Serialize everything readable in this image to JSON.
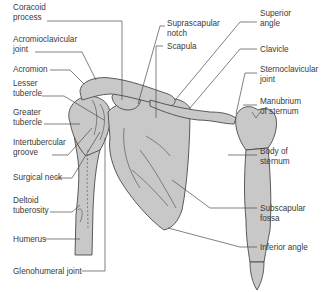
{
  "diagram": {
    "colors": {
      "bone_fill": "#c8c8c8",
      "outline": "#4a4a4a",
      "text": "#3a3a3a",
      "background": "#ffffff"
    },
    "labels_left": [
      {
        "id": "coracoid",
        "lines": [
          "Coracoid",
          "process"
        ]
      },
      {
        "id": "acromioclavicular",
        "lines": [
          "Acromioclavicular",
          "joint"
        ]
      },
      {
        "id": "acromion",
        "lines": [
          "Acromion"
        ]
      },
      {
        "id": "lesser-tubercle",
        "lines": [
          "Lesser",
          "tubercle"
        ]
      },
      {
        "id": "greater-tubercle",
        "lines": [
          "Greater",
          "tubercle"
        ]
      },
      {
        "id": "intertubercular",
        "lines": [
          "Intertubercular",
          "groove"
        ]
      },
      {
        "id": "surgical-neck",
        "lines": [
          "Surgical neck"
        ]
      },
      {
        "id": "deltoid-tuberosity",
        "lines": [
          "Deltoid",
          "tuberosity"
        ]
      },
      {
        "id": "humerus",
        "lines": [
          "Humerus"
        ]
      },
      {
        "id": "glenohumeral",
        "lines": [
          "Glenohumeral joint"
        ]
      }
    ],
    "labels_center": [
      {
        "id": "suprascapular-notch",
        "lines": [
          "Suprascapular",
          "notch"
        ]
      },
      {
        "id": "scapula",
        "lines": [
          "Scapula"
        ]
      }
    ],
    "labels_right": [
      {
        "id": "superior-angle",
        "lines": [
          "Superior",
          "angle"
        ]
      },
      {
        "id": "clavicle",
        "lines": [
          "Clavicle"
        ]
      },
      {
        "id": "sternoclavicular",
        "lines": [
          "Sternoclavicular",
          "joint"
        ]
      },
      {
        "id": "manubrium",
        "lines": [
          "Manubrium",
          "of sternum"
        ]
      },
      {
        "id": "body-sternum",
        "lines": [
          "Body of",
          "sternum"
        ]
      },
      {
        "id": "subscapular-fossa",
        "lines": [
          "Subscapular",
          "fossa"
        ]
      },
      {
        "id": "inferior-angle",
        "lines": [
          "Inferior angle"
        ]
      }
    ]
  }
}
